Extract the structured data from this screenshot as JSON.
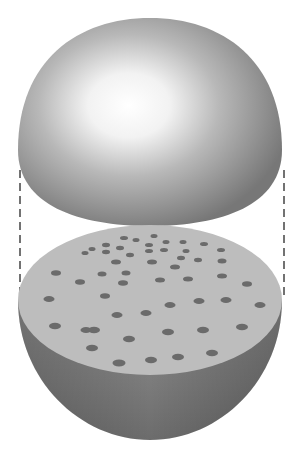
{
  "diagram": {
    "colors": {
      "background": "#ffffff",
      "dome_highlight": "#ffffff",
      "dome_mid": "#b5b5b5",
      "dome_edge": "#7a7a7a",
      "cut_face": "#bdbdbd",
      "bowl_light": "#8a8a8a",
      "bowl_dark": "#6a6a6a",
      "dots": "#6b6b6b",
      "dash_line": "#444444"
    },
    "parts": [
      {
        "name": "upper-hemisphere",
        "label": ""
      },
      {
        "name": "lower-hemisphere",
        "label": ""
      },
      {
        "name": "cut-face",
        "label": ""
      },
      {
        "name": "dashed-guides",
        "label": ""
      }
    ]
  }
}
